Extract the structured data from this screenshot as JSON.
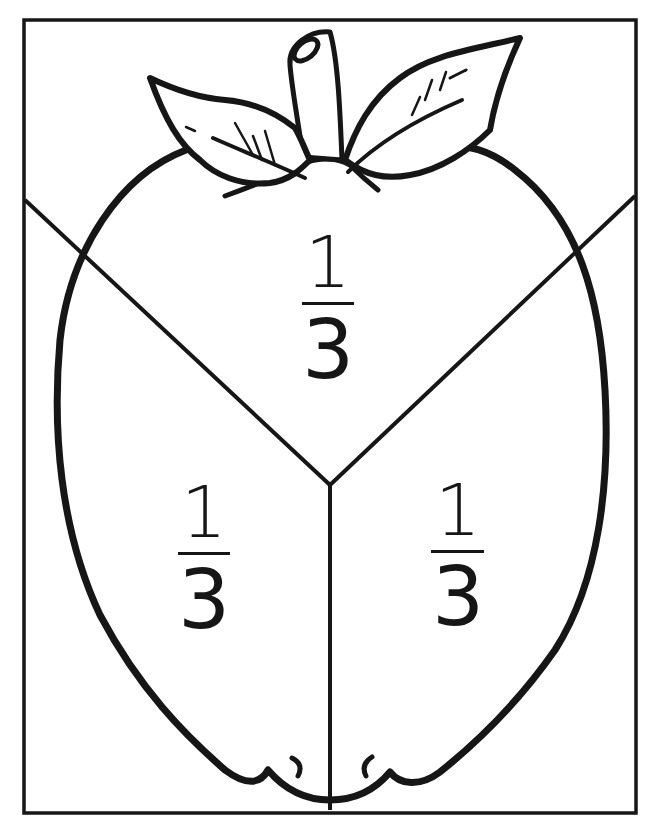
{
  "worksheet": {
    "subject": "apple divided into thirds",
    "colors": {
      "ink": "#161616",
      "paper": "#ffffff"
    },
    "fractions": [
      {
        "id": "top",
        "numerator": "1",
        "denominator": "3"
      },
      {
        "id": "left",
        "numerator": "1",
        "denominator": "3"
      },
      {
        "id": "right",
        "numerator": "1",
        "denominator": "3"
      }
    ]
  }
}
